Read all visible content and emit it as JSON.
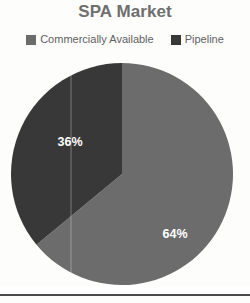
{
  "chart_data": {
    "type": "pie",
    "title": "SPA Market",
    "categories": [
      "Commercially Available",
      "Pipeline"
    ],
    "values": [
      64,
      36
    ],
    "data_labels": [
      "64%",
      "36%"
    ],
    "colors": [
      "#6c6c6c",
      "#383838"
    ],
    "legend_position": "top",
    "start_angle_deg": 0,
    "direction": "clockwise",
    "units": "percent",
    "grid": false,
    "xlabel": "",
    "ylabel": ""
  },
  "title": {
    "text": "SPA Market",
    "color": "#6f6f6f"
  },
  "legend": {
    "items": [
      {
        "label": "Commercially Available",
        "color": "#6c6c6c",
        "swatch_name": "legend-swatch-commercially-available"
      },
      {
        "label": "Pipeline",
        "color": "#383838",
        "swatch_name": "legend-swatch-pipeline"
      }
    ]
  },
  "pie": {
    "slices": [
      {
        "name": "Commercially Available",
        "label": "64%",
        "value": 64,
        "color": "#6c6c6c"
      },
      {
        "name": "Pipeline",
        "label": "36%",
        "value": 36,
        "color": "#383838"
      }
    ],
    "label_color": "#ffffff"
  }
}
